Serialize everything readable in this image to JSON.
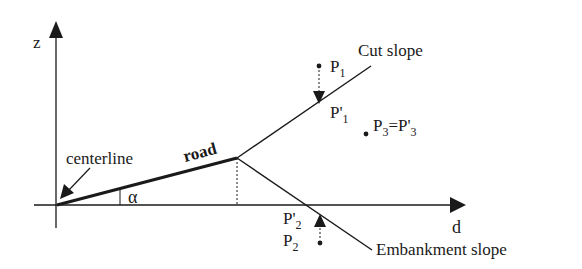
{
  "diagram": {
    "axes": {
      "vertical_label": "z",
      "horizontal_label": "d"
    },
    "labels": {
      "centerline": "centerline",
      "road": "road",
      "angle": "α",
      "cut_slope": "Cut slope",
      "embankment_slope": "Embankment slope"
    },
    "points": {
      "p1": {
        "base": "P",
        "sub": "1"
      },
      "p1_prime": {
        "base": "P'",
        "sub": "1"
      },
      "p2": {
        "base": "P",
        "sub": "2"
      },
      "p2_prime": {
        "base": "P'",
        "sub": "2"
      },
      "p3": {
        "base": "P",
        "sub": "3",
        "eq": "=P'",
        "sub2": "3"
      }
    },
    "colors": {
      "ink": "#1a1a1a",
      "background": "#ffffff"
    }
  }
}
